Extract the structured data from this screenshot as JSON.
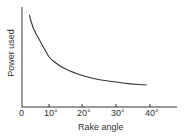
{
  "chart_data": {
    "type": "line",
    "title": "",
    "xlabel": "Rake angle",
    "ylabel": "Power used",
    "x_tick_labels": [
      "0",
      "10°",
      "20°",
      "30°",
      "40°"
    ],
    "x_ticks": [
      0,
      10,
      20,
      30,
      40
    ],
    "y_tick_labels": [],
    "xlim": [
      0,
      48
    ],
    "ylim": [
      0,
      100
    ],
    "grid": false,
    "legend": null,
    "series": [
      {
        "name": "Power used",
        "x": [
          4,
          5,
          7,
          9,
          10,
          13,
          16,
          20,
          25,
          30,
          34,
          39
        ],
        "y": [
          92,
          79,
          67,
          55,
          49,
          41,
          36,
          31,
          27,
          25,
          23,
          22
        ]
      }
    ],
    "note": "Y-axis has no numeric scale; values are relative (0 = x-axis, 100 = top of y-axis)."
  },
  "labels": {
    "x0": "0",
    "x10": "10°",
    "x20": "20°",
    "x30": "30°",
    "x40": "40°",
    "xlabel": "Rake angle",
    "ylabel": "Power used"
  }
}
